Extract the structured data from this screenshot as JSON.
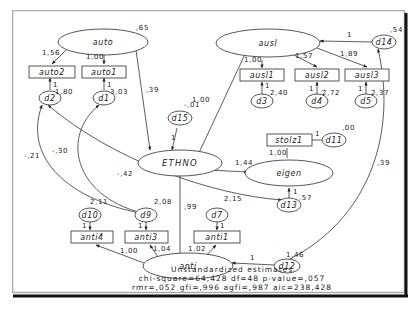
{
  "diagram": {
    "type": "structural-equation-model",
    "latents": {
      "auto": {
        "label": "auto",
        "variance": ",65"
      },
      "ausl": {
        "label": "ausl"
      },
      "ethno": {
        "label": "ETHNO"
      },
      "eigen": {
        "label": "eigen"
      },
      "anti": {
        "label": "anti"
      }
    },
    "observed": {
      "auto2": {
        "label": "auto2"
      },
      "auto1": {
        "label": "auto1"
      },
      "ausl1": {
        "label": "ausl1"
      },
      "ausl2": {
        "label": "ausl2"
      },
      "ausl3": {
        "label": "ausl3"
      },
      "stolz1": {
        "label": "stolz1"
      },
      "anti4": {
        "label": "anti4"
      },
      "anti3": {
        "label": "anti3"
      },
      "anti1": {
        "label": "anti1"
      }
    },
    "errors": {
      "d1": {
        "label": "d1",
        "variance": "3,03"
      },
      "d2": {
        "label": "d2",
        "variance": "1,80"
      },
      "d3": {
        "label": "d3",
        "variance": "2,40"
      },
      "d4": {
        "label": "d4",
        "variance": "2,72"
      },
      "d5": {
        "label": "d5",
        "variance": "2,37"
      },
      "d7": {
        "label": "d7",
        "variance": "2,15"
      },
      "d9": {
        "label": "d9",
        "variance": "2,08"
      },
      "d10": {
        "label": "d10",
        "variance": "2,11"
      },
      "d11": {
        "label": "d11",
        "variance": ",00"
      },
      "d12": {
        "label": "d12",
        "variance": "1,46"
      },
      "d13": {
        "label": "d13",
        "variance": ",57"
      },
      "d14": {
        "label": "d14",
        "variance": ",54"
      },
      "d15": {
        "label": "d15",
        "variance": "-,01"
      }
    },
    "paths": {
      "auto_auto2": "1,56",
      "auto_auto1": "1,00",
      "auto_ethno": ",39",
      "ethno_ausl": "1,00",
      "ausl_ausl1": "1,00",
      "ausl_ausl2": "1,57",
      "ausl_ausl3": "1,89",
      "d14_ausl": "1",
      "ethno_eigen": "1,44",
      "eigen_stolz1": "1,00",
      "d11_stolz1": "1",
      "d13_eigen": "1",
      "ethno_anti": ",99",
      "anti_anti4": "1,00",
      "anti_anti3": "1,04",
      "anti_anti1": "1,02",
      "d12_anti": "1",
      "d15_ethno": "1",
      "err_one": "1"
    },
    "covariances": {
      "d2_d9": "-,21",
      "d1_d9": "-,30",
      "d2_d13": "-,42",
      "d14_d12": ",39"
    },
    "caption": {
      "line1": "Unstandardized estimates",
      "line2": "chi-square=64,428 df=48 p-value=,057",
      "line3": "rmr=,052 gfi=,996 agfi=,987 aic=238,428"
    }
  }
}
